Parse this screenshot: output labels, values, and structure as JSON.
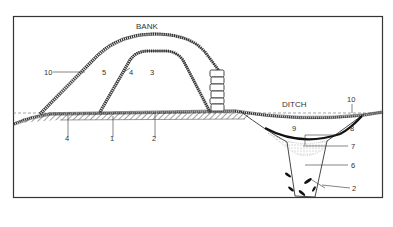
{
  "diagram": {
    "type": "archaeological cross-section",
    "titles": {
      "bank": "BANK",
      "ditch": "DITCH"
    },
    "labels": [
      {
        "id": "10a",
        "text": "10",
        "target": "outer turf line of bank"
      },
      {
        "id": "5",
        "text": "5",
        "target": "later bank fill"
      },
      {
        "id": "4a",
        "text": "4",
        "target": "inner turf line of primary bank"
      },
      {
        "id": "3",
        "text": "3",
        "target": "primary bank core"
      },
      {
        "id": "4b",
        "text": "4",
        "target": "buried turf under bank"
      },
      {
        "id": "1",
        "text": "1",
        "target": "old ground surface"
      },
      {
        "id": "2a",
        "text": "2",
        "target": "buried soil layer"
      },
      {
        "id": "10b",
        "text": "10",
        "target": "modern turf over ditch"
      },
      {
        "id": "9",
        "text": "9",
        "target": "upper ditch fill"
      },
      {
        "id": "8",
        "text": "8",
        "target": "dark turf line in ditch"
      },
      {
        "id": "7",
        "text": "7",
        "target": "stippled silt layer"
      },
      {
        "id": "6",
        "text": "6",
        "target": "main ditch fill"
      },
      {
        "id": "2b",
        "text": "2",
        "target": "stones in ditch bottom"
      }
    ],
    "colors": {
      "line": "#333333",
      "background": "#ffffff",
      "stipple": "#b8b8b8"
    }
  }
}
